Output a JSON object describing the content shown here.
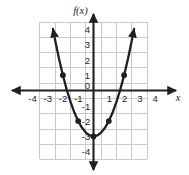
{
  "figure": {
    "name": "coordinate-plane-parabola",
    "background_color": "#ffffff",
    "grid_color": "#c9c9c9",
    "axis_color": "#231f20",
    "curve_color": "#231f20",
    "point_color": "#231f20"
  },
  "axes": {
    "y_axis_label": "f(x)",
    "x_axis_label": "x",
    "x_ticks": [
      "-4",
      "-3",
      "-2",
      "-1",
      "1",
      "2",
      "3",
      "4"
    ],
    "y_ticks": [
      "4",
      "3",
      "2",
      "1",
      "-1",
      "-2",
      "-3",
      "-4"
    ],
    "origin_label": "0",
    "x_range": [
      -4,
      4
    ],
    "y_range": [
      -4,
      4
    ],
    "grid": "on",
    "arrowheads": [
      "x-negative",
      "x-positive",
      "y-positive",
      "y-negative"
    ]
  },
  "chart_data": {
    "type": "line",
    "title": "",
    "xlabel": "x",
    "ylabel": "f(x)",
    "xlim": [
      -4,
      4
    ],
    "ylim": [
      -4,
      4
    ],
    "grid": true,
    "legend": "none",
    "series": [
      {
        "name": "f(x) = x^2 - 3",
        "equation": "f(x) = x^2 - 3",
        "marked_points": [
          {
            "x": -2,
            "y": 1
          },
          {
            "x": -1,
            "y": -2
          },
          {
            "x": 0,
            "y": -3
          },
          {
            "x": 1,
            "y": -2
          },
          {
            "x": 2,
            "y": 1
          }
        ],
        "x": [
          -2.65,
          -2.5,
          -2.25,
          -2,
          -1.75,
          -1.5,
          -1.25,
          -1,
          -0.75,
          -0.5,
          -0.25,
          0,
          0.25,
          0.5,
          0.75,
          1,
          1.25,
          1.5,
          1.75,
          2,
          2.25,
          2.5,
          2.65
        ],
        "y": [
          4.02,
          3.25,
          2.06,
          1,
          0.06,
          -0.75,
          -1.44,
          -2,
          -2.44,
          -2.75,
          -2.94,
          -3,
          -2.94,
          -2.75,
          -2.44,
          -2,
          -1.44,
          -0.75,
          0.06,
          1,
          2.06,
          3.25,
          4.02
        ],
        "vertex": {
          "x": 0,
          "y": -3
        },
        "opens": "up",
        "end_arrows": [
          "upper-left",
          "upper-right"
        ]
      }
    ]
  }
}
